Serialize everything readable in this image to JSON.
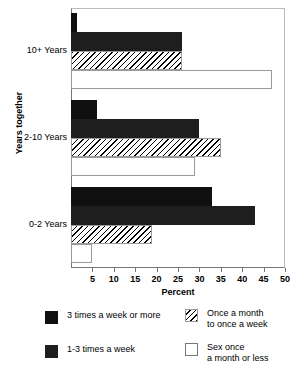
{
  "chart_data": {
    "type": "bar",
    "orientation": "horizontal",
    "title": "",
    "xlabel": "Percent",
    "ylabel": "Years together",
    "categories": [
      "10+ Years",
      "2-10 Years",
      "0-2 Years"
    ],
    "xlim": [
      0,
      50
    ],
    "xticks": [
      5,
      10,
      15,
      20,
      25,
      30,
      35,
      40,
      45,
      50
    ],
    "grid": false,
    "legend_position": "bottom",
    "series": [
      {
        "name": "3 times a week or more",
        "style": "solid-black",
        "values": [
          1.3,
          6.0,
          33.0
        ]
      },
      {
        "name": "1-3 times a week",
        "style": "solid-dark",
        "values": [
          26.0,
          30.0,
          43.0
        ]
      },
      {
        "name": "Once a month\nto once a week",
        "style": "hatched",
        "values": [
          26.0,
          35.0,
          19.0
        ]
      },
      {
        "name": "Sex once\na month or less",
        "style": "open",
        "values": [
          47.0,
          29.0,
          5.0
        ]
      }
    ]
  },
  "axis": {
    "ylabel": "Years together",
    "xlabel": "Percent",
    "ytick_labels": [
      "10+ Years",
      "2-10 Years",
      "0-2 Years"
    ],
    "xtick_labels": [
      "5",
      "10",
      "15",
      "20",
      "25",
      "30",
      "35",
      "40",
      "45",
      "50"
    ]
  },
  "legend": {
    "entries": [
      {
        "label": "3 times a week or more",
        "style": "solid-black"
      },
      {
        "label": "Once a month\nto once a week",
        "style": "hatched"
      },
      {
        "label": "1-3 times a week",
        "style": "solid-dark"
      },
      {
        "label": "Sex once\na month or less",
        "style": "open"
      }
    ]
  },
  "colors": {
    "bar_black": "#101010",
    "bar_dark": "#1e1e1e",
    "hatch_line": "#000000",
    "outline": "#9a9a9a",
    "axis": "#777777",
    "background": "#ffffff"
  }
}
